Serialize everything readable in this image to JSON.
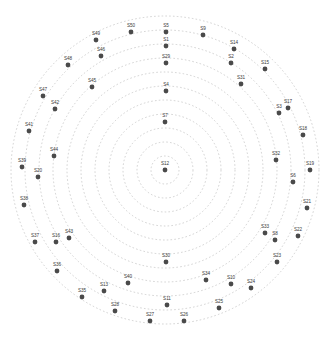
{
  "figure": {
    "title": "",
    "background_color": "#ffffff",
    "point_color": "#4a4a4a",
    "ring_color": "#b9b9b9",
    "label_color": "#3a3a3a",
    "width": 334,
    "height": 350
  },
  "chart_data": {
    "type": "scatter",
    "title": "",
    "xlabel": "",
    "ylabel": "",
    "coordinate_system": "polar",
    "grid": true,
    "grid_style": "dotted concentric circles",
    "legend": "none",
    "center": {
      "x": 165,
      "y": 170
    },
    "ring_radii": [
      14,
      28,
      42,
      56,
      70,
      84,
      98,
      112,
      126,
      140,
      154
    ],
    "ring_count": 11,
    "rlim": [
      0,
      154
    ],
    "theta_units": "degrees",
    "points": [
      {
        "label": "S12",
        "x": 165,
        "y": 170,
        "r": 0,
        "theta": 0
      },
      {
        "label": "S7",
        "x": 165,
        "y": 122,
        "r": 48,
        "theta": 90
      },
      {
        "label": "S4",
        "x": 166,
        "y": 91,
        "r": 79,
        "theta": 90
      },
      {
        "label": "S29",
        "x": 166,
        "y": 63,
        "r": 107,
        "theta": 90
      },
      {
        "label": "S1",
        "x": 166,
        "y": 46,
        "r": 124,
        "theta": 90
      },
      {
        "label": "S5",
        "x": 166,
        "y": 32,
        "r": 138,
        "theta": 90
      },
      {
        "label": "S9",
        "x": 203,
        "y": 35,
        "r": 140,
        "theta": 74
      },
      {
        "label": "S14",
        "x": 234,
        "y": 49,
        "r": 141,
        "theta": 60
      },
      {
        "label": "S2",
        "x": 231,
        "y": 63,
        "r": 126,
        "theta": 58
      },
      {
        "label": "S15",
        "x": 265,
        "y": 69,
        "r": 146,
        "theta": 47
      },
      {
        "label": "S31",
        "x": 241,
        "y": 84,
        "r": 121,
        "theta": 45
      },
      {
        "label": "S17",
        "x": 288,
        "y": 108,
        "r": 139,
        "theta": 29
      },
      {
        "label": "S3",
        "x": 279,
        "y": 113,
        "r": 129,
        "theta": 26
      },
      {
        "label": "S18",
        "x": 303,
        "y": 135,
        "r": 142,
        "theta": 14
      },
      {
        "label": "S32",
        "x": 276,
        "y": 160,
        "r": 111,
        "theta": 5
      },
      {
        "label": "S19",
        "x": 310,
        "y": 170,
        "r": 145,
        "theta": 0
      },
      {
        "label": "S6",
        "x": 293,
        "y": 182,
        "r": 128,
        "theta": -5
      },
      {
        "label": "S21",
        "x": 307,
        "y": 208,
        "r": 148,
        "theta": -15
      },
      {
        "label": "S33",
        "x": 265,
        "y": 233,
        "r": 117,
        "theta": -33
      },
      {
        "label": "S8",
        "x": 275,
        "y": 240,
        "r": 132,
        "theta": -32
      },
      {
        "label": "S22",
        "x": 298,
        "y": 236,
        "r": 146,
        "theta": -24
      },
      {
        "label": "S23",
        "x": 277,
        "y": 262,
        "r": 142,
        "theta": -41
      },
      {
        "label": "S10",
        "x": 231,
        "y": 284,
        "r": 131,
        "theta": -60
      },
      {
        "label": "S24",
        "x": 251,
        "y": 288,
        "r": 144,
        "theta": -53
      },
      {
        "label": "S34",
        "x": 206,
        "y": 280,
        "r": 116,
        "theta": -69
      },
      {
        "label": "S25",
        "x": 219,
        "y": 308,
        "r": 145,
        "theta": -68
      },
      {
        "label": "S11",
        "x": 167,
        "y": 305,
        "r": 135,
        "theta": -90
      },
      {
        "label": "S26",
        "x": 184,
        "y": 321,
        "r": 152,
        "theta": -83
      },
      {
        "label": "S27",
        "x": 150,
        "y": 321,
        "r": 152,
        "theta": -96
      },
      {
        "label": "S30",
        "x": 166,
        "y": 262,
        "r": 92,
        "theta": -90
      },
      {
        "label": "S28",
        "x": 115,
        "y": 311,
        "r": 150,
        "theta": -109
      },
      {
        "label": "S40",
        "x": 128,
        "y": 283,
        "r": 120,
        "theta": -109
      },
      {
        "label": "S13",
        "x": 104,
        "y": 291,
        "r": 131,
        "theta": -118
      },
      {
        "label": "S35",
        "x": 82,
        "y": 297,
        "r": 150,
        "theta": -125
      },
      {
        "label": "S36",
        "x": 57,
        "y": 271,
        "r": 146,
        "theta": -140
      },
      {
        "label": "S16",
        "x": 56,
        "y": 242,
        "r": 133,
        "theta": -148
      },
      {
        "label": "S37",
        "x": 35,
        "y": 242,
        "r": 144,
        "theta": -152
      },
      {
        "label": "S43",
        "x": 69,
        "y": 238,
        "r": 116,
        "theta": -147
      },
      {
        "label": "S38",
        "x": 24,
        "y": 205,
        "r": 145,
        "theta": -166
      },
      {
        "label": "S20",
        "x": 38,
        "y": 177,
        "r": 127,
        "theta": -177
      },
      {
        "label": "S39",
        "x": 22,
        "y": 167,
        "r": 143,
        "theta": 179
      },
      {
        "label": "S44",
        "x": 54,
        "y": 156,
        "r": 112,
        "theta": 172
      },
      {
        "label": "S41",
        "x": 29,
        "y": 131,
        "r": 141,
        "theta": 164
      },
      {
        "label": "S42",
        "x": 55,
        "y": 109,
        "r": 124,
        "theta": 152
      },
      {
        "label": "S47",
        "x": 43,
        "y": 96,
        "r": 144,
        "theta": 149
      },
      {
        "label": "S45",
        "x": 92,
        "y": 87,
        "r": 114,
        "theta": 134
      },
      {
        "label": "S48",
        "x": 68,
        "y": 65,
        "r": 146,
        "theta": 135
      },
      {
        "label": "S46",
        "x": 101,
        "y": 56,
        "r": 130,
        "theta": 123
      },
      {
        "label": "S49",
        "x": 96,
        "y": 40,
        "r": 146,
        "theta": 119
      },
      {
        "label": "S50",
        "x": 131,
        "y": 32,
        "r": 140,
        "theta": 104
      }
    ]
  }
}
